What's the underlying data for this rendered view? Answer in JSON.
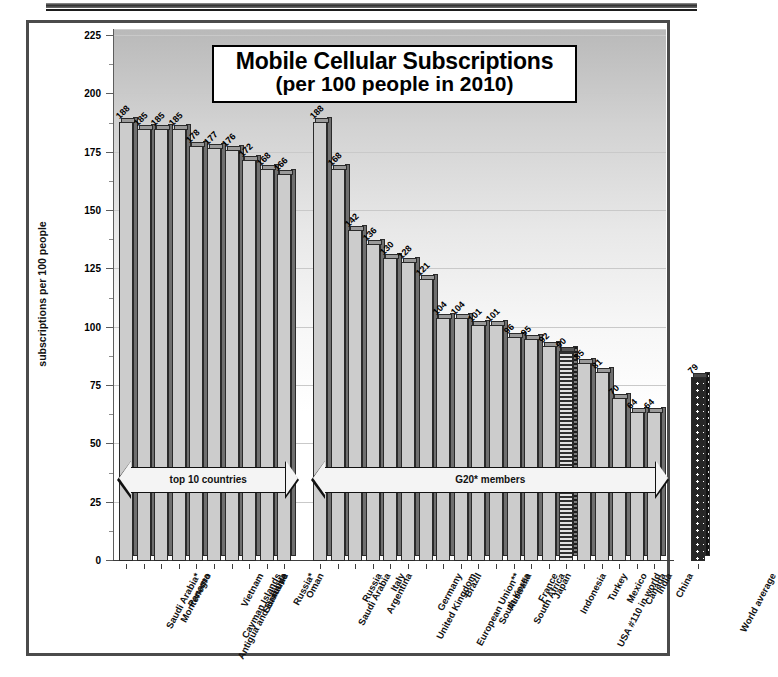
{
  "chart_data": {
    "type": "bar",
    "title": "Mobile Cellular Subscriptions",
    "subtitle": "(per 100 people in 2010)",
    "xlabel": "",
    "ylabel": "subscriptions per 100 people",
    "ylim": [
      0,
      225
    ],
    "yticks": [
      0,
      25,
      50,
      75,
      100,
      125,
      150,
      175,
      200,
      225
    ],
    "grid": true,
    "legend": "none",
    "categories": [
      "Saudi Arabia*",
      "Montenegro",
      "Panama",
      "Antigua and Barbuda",
      "Cayman Islands",
      "Vietnam",
      "Suriname",
      "Libya",
      "Russia*",
      "Oman",
      "Saudi Arabia",
      "Russia",
      "Argentina",
      "Italy",
      "United Kingdom",
      "Germany",
      "European Union**",
      "Brazil",
      "South Korea",
      "Australia",
      "South Africa",
      "France",
      "Japan",
      "Indonesia",
      "USA #110 in world",
      "Turkey",
      "Mexico",
      "Canada",
      "India",
      "China",
      "World average"
    ],
    "values": [
      188,
      185,
      185,
      185,
      178,
      177,
      176,
      172,
      168,
      166,
      188,
      168,
      142,
      136,
      130,
      128,
      121,
      104,
      104,
      101,
      101,
      96,
      95,
      92,
      90,
      85,
      81,
      70,
      64,
      64,
      79
    ],
    "groups": [
      {
        "label": "top 10 countries",
        "start_index": 0,
        "end_index": 9
      },
      {
        "label": "G20* members",
        "start_index": 10,
        "end_index": 29
      }
    ],
    "highlight_bars": [
      {
        "index": 24,
        "name": "usa",
        "style": "hatched"
      },
      {
        "index": 30,
        "name": "world",
        "style": "dotted-dark"
      }
    ]
  },
  "title": {
    "line1": "Mobile Cellular Subscriptions",
    "line2": "(per 100 people in 2010)"
  },
  "axes": {
    "y_title": "subscriptions per 100 people"
  }
}
